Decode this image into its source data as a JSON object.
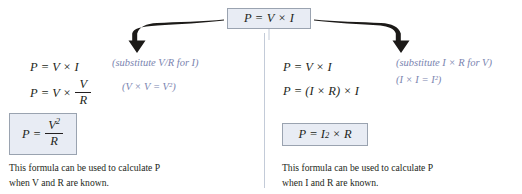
{
  "diagram": {
    "title_formula": "P = V × I",
    "top_box": {
      "p": "P",
      "eq": "=",
      "v": "V",
      "times": "×",
      "i": "I"
    },
    "divider_color": "#c3cbd8",
    "box_fill_color": "#e8ecf4",
    "box_border_color": "#9aa3b0",
    "note_color": "#7b85b0",
    "text_color": "#231f20",
    "background_color": "#ffffff"
  },
  "left_branch": {
    "arrow": "curved-arrow-left-down",
    "step1": {
      "lhs": "P",
      "eq": "=",
      "rhs": "V × I"
    },
    "step2": {
      "lhs": "P",
      "eq": "=",
      "prefix": "V ×",
      "numerator": "V",
      "denominator": "R"
    },
    "note1": "(substitute V/R for I)",
    "note2": "(V × V = V²)",
    "result": {
      "lhs": "P",
      "eq": "=",
      "numerator": "V",
      "numerator_exponent": "2",
      "denominator": "R"
    },
    "caption_line1": "This formula can be used to calculate P",
    "caption_line2": "when V and R are known."
  },
  "right_branch": {
    "arrow": "curved-arrow-right-down",
    "step1": {
      "lhs": "P",
      "eq": "=",
      "rhs": "V × I"
    },
    "step2": {
      "lhs": "P",
      "eq": "=",
      "rhs": "(I × R) × I"
    },
    "note1": "(substitute I × R for V)",
    "note2": "(I × I = I²)",
    "result": {
      "lhs": "P",
      "eq": "=",
      "base": "I",
      "exponent": "2",
      "times": "×",
      "factor": "R"
    },
    "caption_line1": "This formula can be used to calculate P",
    "caption_line2": "when I and R are known."
  }
}
